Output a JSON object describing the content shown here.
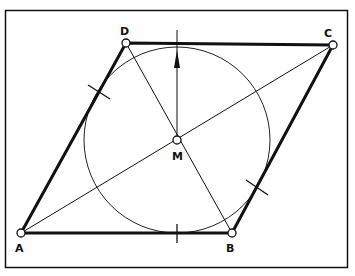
{
  "diagram": {
    "points": {
      "A": {
        "label": "A",
        "x": 21,
        "y": 233,
        "lx": 15,
        "ly": 252
      },
      "B": {
        "label": "B",
        "x": 232,
        "y": 233,
        "lx": 226,
        "ly": 252
      },
      "C": {
        "label": "C",
        "x": 333,
        "y": 45,
        "lx": 324,
        "ly": 37
      },
      "D": {
        "label": "D",
        "x": 126,
        "y": 43,
        "lx": 120,
        "ly": 35
      },
      "M": {
        "label": "M",
        "x": 177,
        "y": 140,
        "lx": 172,
        "ly": 160
      }
    },
    "circle": {
      "cx": 177,
      "cy": 140,
      "r": 93
    },
    "arrow": {
      "from_y": 140,
      "to_y": 30
    },
    "colors": {
      "stroke": "#111111",
      "background": "#ffffff"
    }
  }
}
